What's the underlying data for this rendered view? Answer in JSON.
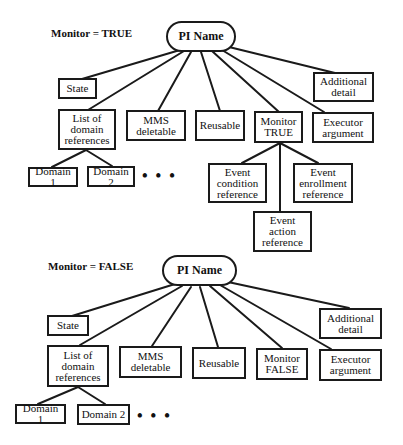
{
  "diagrams": [
    {
      "title": "Monitor = TRUE",
      "root": "PI Name",
      "nodes": {
        "state": "State",
        "domain_list": "List of\ndomain\nreferences",
        "mms": "MMS\ndeletable",
        "reusable": "Reusable",
        "monitor": "Monitor\nTRUE",
        "executor": "Executor\nargument",
        "additional": "Additional\ndetail",
        "domain1": "Domain 1",
        "domain2": "Domain 2",
        "ellipsis": "• • •",
        "event_condition": "Event\ncondition\nreference",
        "event_action": "Event\naction\nreference",
        "event_enrollment": "Event\nenrollment\nreference"
      }
    },
    {
      "title": "Monitor = FALSE",
      "root": "PI Name",
      "nodes": {
        "state": "State",
        "domain_list": "List of\ndomain\nreferences",
        "mms": "MMS\ndeletable",
        "reusable": "Reusable",
        "monitor": "Monitor\nFALSE",
        "executor": "Executor\nargument",
        "additional": "Additional\ndetail",
        "domain1": "Domain 1",
        "domain2": "Domain 2",
        "ellipsis": "• • •"
      }
    }
  ]
}
